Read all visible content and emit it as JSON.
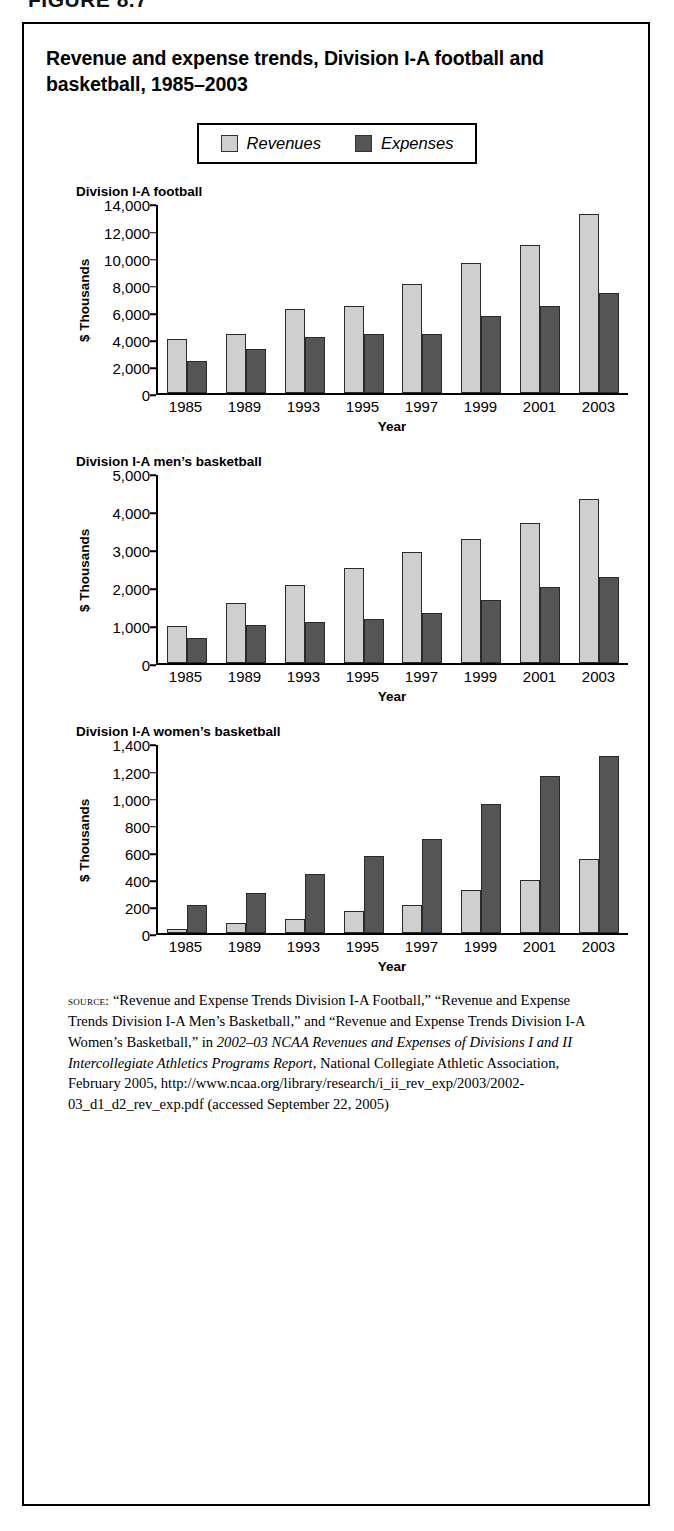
{
  "figure_caption": "FIGURE 8.7",
  "figure": {
    "title": "Revenue and expense trends, Division I-A football and basketball, 1985–2003"
  },
  "legend": {
    "items": [
      {
        "label": "Revenues",
        "color": "#cfcfcf",
        "swatch_name": "revenues-swatch"
      },
      {
        "label": "Expenses",
        "color": "#555555",
        "swatch_name": "expenses-swatch"
      }
    ]
  },
  "colors": {
    "revenues": "#cfcfcf",
    "expenses": "#555555",
    "axis": "#000000",
    "border": "#000000",
    "background": "#ffffff"
  },
  "source": {
    "label": "source:",
    "text": " “Revenue and Expense Trends Division I-A Football,” “Revenue and Expense Trends Division I-A Men’s Basketball,” and “Revenue and Expense Trends Division I-A Women’s Basketball,” in ",
    "italic_title": "2002–03 NCAA Revenues and Expenses of Divisions I and II Intercollegiate Athletics Programs Report",
    "text_after": ", National Collegiate Athletic Association, February 2005, http://www.ncaa.org/library/research/i_ii_rev_exp/2003/2002-03_d1_d2_rev_exp.pdf (accessed September 22, 2005)"
  },
  "chart_data": [
    {
      "type": "bar",
      "title": "Division I-A football",
      "xlabel": "Year",
      "ylabel": "$ Thousands",
      "categories": [
        "1985",
        "1989",
        "1993",
        "1995",
        "1997",
        "1999",
        "2001",
        "2003"
      ],
      "ylim": [
        0,
        14000
      ],
      "yticks": [
        0,
        2000,
        4000,
        6000,
        8000,
        10000,
        12000,
        14000
      ],
      "ytick_labels": [
        "0",
        "2,000",
        "4,000",
        "6,000",
        "8,000",
        "10,000",
        "12,000",
        "14,000"
      ],
      "grid": false,
      "legend_position": "top-center",
      "series": [
        {
          "name": "Revenues",
          "values": [
            4000,
            4350,
            6250,
            6450,
            8050,
            9600,
            10950,
            13200
          ]
        },
        {
          "name": "Expenses",
          "values": [
            2400,
            3300,
            4150,
            4400,
            4400,
            5700,
            6450,
            7400
          ]
        }
      ]
    },
    {
      "type": "bar",
      "title": "Division I-A men’s basketball",
      "xlabel": "Year",
      "ylabel": "$ Thousands",
      "categories": [
        "1985",
        "1989",
        "1993",
        "1995",
        "1997",
        "1999",
        "2001",
        "2003"
      ],
      "ylim": [
        0,
        5000
      ],
      "yticks": [
        0,
        1000,
        2000,
        3000,
        4000,
        5000
      ],
      "ytick_labels": [
        "0",
        "1,000",
        "2,000",
        "3,000",
        "4,000",
        "5,000"
      ],
      "grid": false,
      "legend_position": "top-center",
      "series": [
        {
          "name": "Revenues",
          "values": [
            990,
            1580,
            2060,
            2520,
            2940,
            3280,
            3690,
            4330
          ]
        },
        {
          "name": "Expenses",
          "values": [
            660,
            1020,
            1090,
            1180,
            1320,
            1680,
            2020,
            2270
          ]
        }
      ]
    },
    {
      "type": "bar",
      "title": "Division I-A women’s basketball",
      "xlabel": "Year",
      "ylabel": "$ Thousands",
      "categories": [
        "1985",
        "1989",
        "1993",
        "1995",
        "1997",
        "1999",
        "2001",
        "2003"
      ],
      "ylim": [
        0,
        1400
      ],
      "yticks": [
        0,
        200,
        400,
        600,
        800,
        1000,
        1200,
        1400
      ],
      "ytick_labels": [
        "0",
        "200",
        "400",
        "600",
        "800",
        "1,000",
        "1,200",
        "1,400"
      ],
      "grid": false,
      "legend_position": "top-center",
      "series": [
        {
          "name": "Revenues",
          "values": [
            30,
            75,
            105,
            165,
            210,
            320,
            395,
            550
          ]
        },
        {
          "name": "Expenses",
          "values": [
            210,
            300,
            440,
            570,
            695,
            955,
            1160,
            1305
          ]
        }
      ]
    }
  ]
}
